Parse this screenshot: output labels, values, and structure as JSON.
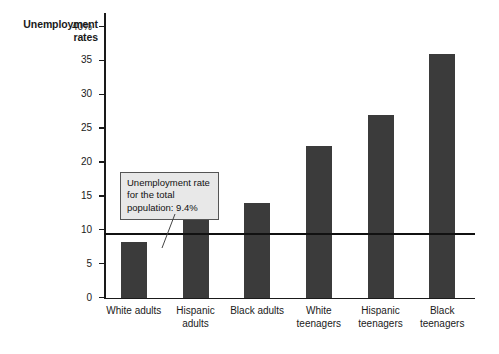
{
  "chart_data": {
    "type": "bar",
    "title": "Unemployment rates",
    "xlabel": "",
    "ylabel": "Unemployment rates",
    "ylim": [
      0,
      42
    ],
    "grid": false,
    "legend": "none",
    "bar_color": "#3b3b3b",
    "categories": [
      "White adults",
      "Hispanic adults",
      "Black adults",
      "White teenagers",
      "Hispanic teenagers",
      "Black teenagers"
    ],
    "values": [
      8.2,
      11.5,
      14.0,
      22.5,
      27.0,
      36.0
    ],
    "ytick_labels": [
      "0",
      "5",
      "10",
      "15",
      "20",
      "25",
      "30",
      "35",
      "40%"
    ],
    "ytick_values": [
      0,
      5,
      10,
      15,
      20,
      25,
      30,
      35,
      40
    ],
    "annotations": [
      {
        "text": "Unemployment rate for the total population: 9.4%",
        "reference_value": 9.4,
        "type": "reference-line-callout"
      }
    ]
  },
  "axis": {
    "title_text": "Unemployment\nrates",
    "ticks": [
      {
        "label": "40%",
        "value": 40
      },
      {
        "label": "35",
        "value": 35
      },
      {
        "label": "30",
        "value": 30
      },
      {
        "label": "25",
        "value": 25
      },
      {
        "label": "20",
        "value": 20
      },
      {
        "label": "15",
        "value": 15
      },
      {
        "label": "10",
        "value": 10
      },
      {
        "label": "5",
        "value": 5
      },
      {
        "label": "0",
        "value": 0
      }
    ]
  },
  "categories": [
    {
      "label": "White adults",
      "value": 8.2
    },
    {
      "label": "Hispanic\nadults",
      "value": 11.5
    },
    {
      "label": "Black adults",
      "value": 14.0
    },
    {
      "label": "White\nteenagers",
      "value": 22.5
    },
    {
      "label": "Hispanic\nteenagers",
      "value": 27.0
    },
    {
      "label": "Black\nteenagers",
      "value": 36.0
    }
  ],
  "annotation": {
    "text": "Unemployment rate for the total population: 9.4%",
    "value": 9.4
  }
}
